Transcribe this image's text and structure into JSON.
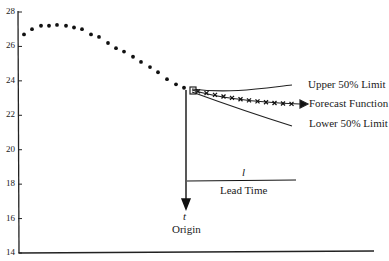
{
  "chart_data": {
    "type": "line",
    "title": "",
    "xlabel": "",
    "ylabel": "",
    "ylim": [
      14,
      28
    ],
    "yticks": [
      14,
      16,
      18,
      20,
      22,
      24,
      26,
      28
    ],
    "grid": false,
    "observed_series": {
      "name": "Observed data",
      "style": "dots",
      "x": [
        1,
        2,
        3,
        4,
        5,
        6,
        7,
        8,
        9,
        10,
        11,
        12,
        13,
        14,
        15,
        16,
        17,
        18,
        19,
        20
      ],
      "values": [
        26.7,
        27.0,
        27.2,
        27.2,
        27.25,
        27.2,
        27.1,
        27.0,
        26.7,
        26.55,
        26.2,
        25.9,
        25.7,
        25.4,
        25.1,
        24.8,
        24.5,
        24.1,
        23.8,
        23.6
      ]
    },
    "series": [
      {
        "name": "Upper 50% Limit",
        "style": "line",
        "x": [
          21,
          34
        ],
        "values": [
          23.6,
          23.6
        ]
      },
      {
        "name": "Forecast Function",
        "style": "line with x markers and arrow",
        "x": [
          21,
          34
        ],
        "values": [
          23.5,
          22.6
        ]
      },
      {
        "name": "Lower 50% Limit",
        "style": "line",
        "x": [
          21,
          34
        ],
        "values": [
          23.4,
          21.3
        ]
      }
    ],
    "annotations": [
      {
        "text": "t",
        "italic": true,
        "meaning": "origin time marker"
      },
      {
        "text": "Origin"
      },
      {
        "text": "l",
        "italic": true,
        "meaning": "lead time symbol"
      },
      {
        "text": "Lead Time"
      }
    ]
  },
  "labels": {
    "upper": "Upper 50% Limit",
    "forecast": "Forecast Function",
    "lower": "Lower 50% Limit",
    "t": "t",
    "origin": "Origin",
    "l": "l",
    "lead_time": "Lead Time"
  },
  "yticks": [
    "28",
    "26",
    "24",
    "22",
    "20",
    "18",
    "16",
    "14"
  ]
}
